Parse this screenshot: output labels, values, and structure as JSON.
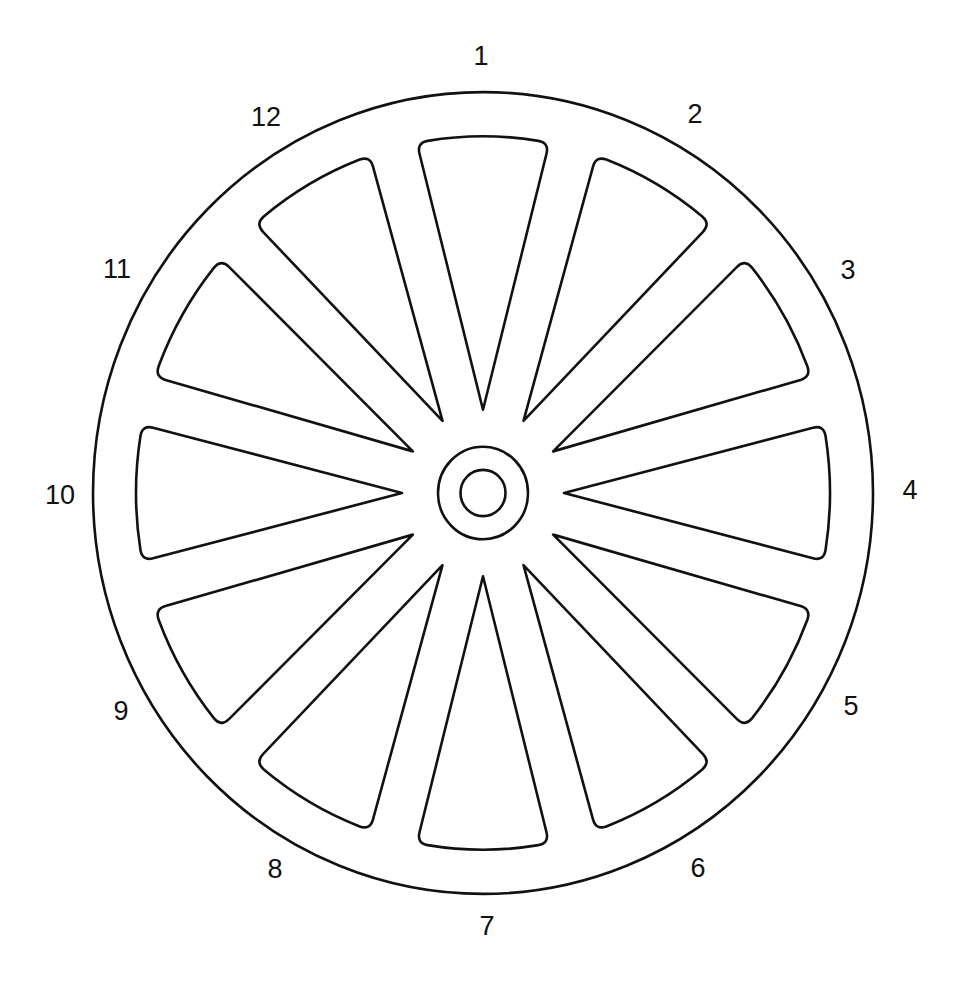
{
  "diagram": {
    "type": "spoked-wheel",
    "opening_count": 12,
    "labels": [
      "1",
      "2",
      "3",
      "4",
      "5",
      "6",
      "7",
      "8",
      "9",
      "10",
      "11",
      "12"
    ],
    "colors": {
      "line": "#111111",
      "background": "#ffffff"
    }
  }
}
